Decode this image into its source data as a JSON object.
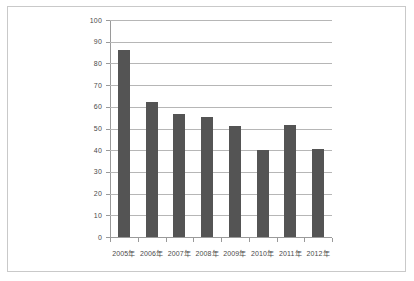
{
  "chart_data": {
    "type": "bar",
    "title": "",
    "subtitle": "",
    "xlabel": "",
    "ylabel": "",
    "categories": [
      "2005年",
      "2006年",
      "2007年",
      "2008年",
      "2009年",
      "2010年",
      "2011年",
      "2012年"
    ],
    "values": [
      86,
      62,
      56.5,
      55.5,
      51,
      40,
      51.5,
      40.5
    ],
    "ylim": [
      0,
      100
    ],
    "ytick_labels": [
      "0",
      "10",
      "20",
      "30",
      "40",
      "50",
      "60",
      "70",
      "80",
      "90",
      "100"
    ],
    "ytick_values": [
      0,
      10,
      20,
      30,
      40,
      50,
      60,
      70,
      80,
      90,
      100
    ],
    "grid": true,
    "legend": false,
    "legend_position": "none",
    "series": [
      {
        "name": "",
        "values": [
          86,
          62,
          56.5,
          55.5,
          51,
          40,
          51.5,
          40.5
        ],
        "color": "#545454"
      }
    ]
  },
  "style": {
    "bar_color": "#545454",
    "gridline_color": "#b6b6b6",
    "axis_color": "#9a9a9a",
    "tick_text_color": "#4a4a4a",
    "page_border_color": "#c9c9c9",
    "background": "#ffffff"
  }
}
